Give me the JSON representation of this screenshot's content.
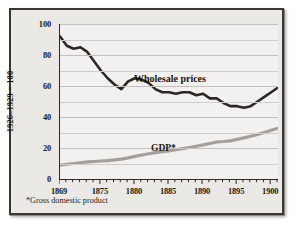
{
  "chart_data": {
    "type": "line",
    "title": "",
    "xlabel": "",
    "ylabel": "1926–1929 = 100",
    "xlim": [
      1869,
      1901
    ],
    "ylim": [
      0,
      100
    ],
    "yticks": [
      0,
      20,
      40,
      60,
      80,
      100
    ],
    "ytick_labels": [
      "0",
      "20",
      "40",
      "60",
      "80",
      "100"
    ],
    "minor_y_step": 10,
    "grid": "horizontal",
    "xticks": [
      1869,
      1875,
      1880,
      1885,
      1890,
      1895,
      1900
    ],
    "xtick_labels": [
      "1869",
      "1875",
      "1880",
      "1885",
      "1890",
      "1895",
      "1900"
    ],
    "x": [
      1869,
      1870,
      1871,
      1872,
      1873,
      1874,
      1875,
      1876,
      1877,
      1878,
      1879,
      1880,
      1881,
      1882,
      1883,
      1884,
      1885,
      1886,
      1887,
      1888,
      1889,
      1890,
      1891,
      1892,
      1893,
      1894,
      1895,
      1896,
      1897,
      1898,
      1899,
      1900,
      1901
    ],
    "series": [
      {
        "name": "Wholesale prices",
        "color": "#2b2825",
        "width": 2.6,
        "label_position": {
          "x": 1878.9,
          "y": 70
        },
        "values": [
          92,
          86,
          84,
          85,
          82,
          76,
          70,
          65,
          61,
          58,
          63,
          65,
          64,
          62,
          58,
          56,
          56,
          55,
          56,
          56,
          54,
          55,
          52,
          52,
          49,
          47,
          47,
          46,
          47,
          50,
          53,
          56,
          59
        ]
      },
      {
        "name": "GDP*",
        "color": "#a3a09b",
        "width": 3.2,
        "label_position": {
          "x": 1881.3,
          "y": 24
        },
        "values": [
          9,
          9.5,
          10,
          10.5,
          11,
          11.3,
          11.6,
          11.9,
          12.3,
          12.8,
          13.6,
          14.6,
          15.5,
          16.3,
          17,
          17.6,
          18.2,
          18.9,
          19.6,
          20.3,
          21.1,
          22,
          22.9,
          23.9,
          24.2,
          24.6,
          25.6,
          26.5,
          27.6,
          28.7,
          30,
          31.4,
          32.8
        ]
      }
    ],
    "annotations": {
      "wholesale_spike": {
        "x": 1899,
        "y": 65,
        "note": "sharp peak"
      },
      "wholesale_dip_after_spike": {
        "x": 1900,
        "y": 53
      }
    }
  },
  "labels": {
    "y_axis_title": "1926–1929 = 100",
    "wholesale_series": "Wholesale prices",
    "gdp_series": "GDP*",
    "footnote": "*Gross domestic product"
  }
}
